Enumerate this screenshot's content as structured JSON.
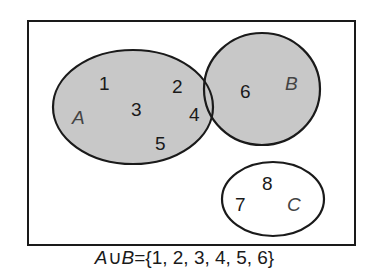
{
  "diagram": {
    "type": "venn",
    "universe": {
      "elements": [
        "1",
        "2",
        "3",
        "4",
        "5",
        "6",
        "7",
        "8"
      ]
    },
    "sets": {
      "A": {
        "label": "A",
        "elements": [
          "1",
          "3",
          "5",
          "2",
          "4"
        ],
        "shaded": true
      },
      "B": {
        "label": "B",
        "elements": [
          "2",
          "4",
          "6"
        ],
        "shaded": true
      },
      "C": {
        "label": "C",
        "elements": [
          "7",
          "8"
        ],
        "shaded": false
      }
    },
    "regions": {
      "a_only": [
        "1",
        "3",
        "5"
      ],
      "a_and_b": [
        "2",
        "4"
      ],
      "b_only": [
        "6"
      ],
      "c_only": [
        "7",
        "8"
      ]
    },
    "numbers": {
      "n1": "1",
      "n2": "2",
      "n3": "3",
      "n4": "4",
      "n5": "5",
      "n6": "6",
      "n7": "7",
      "n8": "8"
    },
    "caption": {
      "lhs_a": "A",
      "union": "∪",
      "lhs_b": "B",
      "equals": "=",
      "rhs": "{1, 2, 3, 4, 5, 6}"
    },
    "colors": {
      "shade": "#c8c8c8",
      "stroke": "#1a1a1a",
      "background": "#ffffff"
    }
  }
}
